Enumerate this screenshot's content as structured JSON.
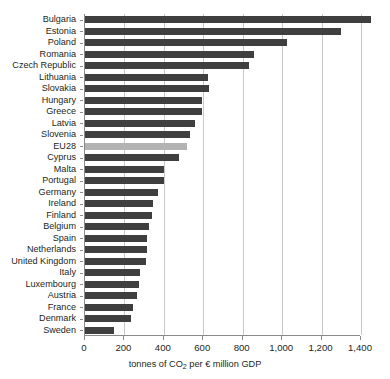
{
  "chart_data": {
    "type": "bar",
    "orientation": "horizontal",
    "title": "",
    "xlabel": "tonnes of CO2 per € million GDP",
    "xlabel_parts": {
      "before": "tonnes of CO",
      "sub": "2",
      "after": " per € million GDP"
    },
    "ylabel": "",
    "xlim": [
      0,
      1400
    ],
    "xticks": [
      0,
      200,
      400,
      600,
      800,
      1000,
      1200,
      1400
    ],
    "xtick_labels": [
      "0",
      "200",
      "400",
      "600",
      "800",
      "1,000",
      "1,200",
      "1,400"
    ],
    "grid": true,
    "grid_axis": "x",
    "legend": "none",
    "bar_color": "#3f3f3f",
    "highlight_color": "#b3b3b3",
    "highlight_category": "EU28",
    "categories": [
      "Bulgaria",
      "Estonia",
      "Poland",
      "Romania",
      "Czech Republic",
      "Lithuania",
      "Slovakia",
      "Hungary",
      "Greece",
      "Latvia",
      "Slovenia",
      "EU28",
      "Cyprus",
      "Malta",
      "Portugal",
      "Germany",
      "Ireland",
      "Finland",
      "Belgium",
      "Spain",
      "Netherlands",
      "United Kingdom",
      "Italy",
      "Luxembourg",
      "Austria",
      "France",
      "Denmark",
      "Sweden"
    ],
    "values": [
      1450,
      1300,
      1025,
      858,
      833,
      625,
      628,
      595,
      592,
      558,
      533,
      517,
      477,
      402,
      400,
      370,
      344,
      340,
      325,
      315,
      313,
      310,
      279,
      276,
      262,
      242,
      234,
      148
    ]
  }
}
